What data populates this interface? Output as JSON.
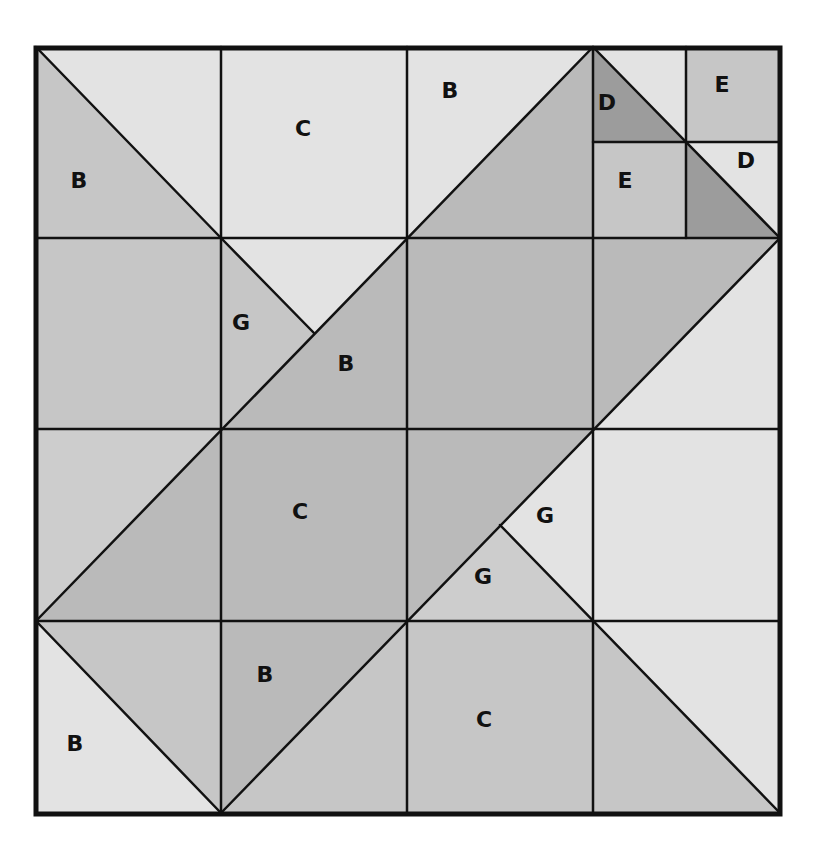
{
  "diagram": {
    "type": "quilt-block-pattern",
    "grid": {
      "rows": 4,
      "cols": 4,
      "x_lines": [
        36,
        221,
        407,
        593,
        780
      ],
      "y_lines": [
        47,
        238,
        429,
        621,
        813
      ],
      "sub_lines": {
        "x": 686,
        "y": 142
      }
    },
    "colors": {
      "light": "#e3e3e3",
      "light_medium": "#cdcdcd",
      "medium": "#c6c6c6",
      "dark": "#bababa",
      "darkest": "#9c9c9c",
      "line": "#111111",
      "label": "#111111"
    },
    "pieces": [
      {
        "id": "r0c0-light",
        "fill": "light",
        "points": "36,47 221,47 221,238"
      },
      {
        "id": "r0c0-B",
        "fill": "medium",
        "points": "36,47 221,238 36,238"
      },
      {
        "id": "r0c1-C",
        "fill": "light",
        "points": "221,47 407,47 407,238 221,238"
      },
      {
        "id": "r0c2-B",
        "fill": "light",
        "points": "407,47 593,47 407,238"
      },
      {
        "id": "r0c2-dark",
        "fill": "dark",
        "points": "593,47 593,238 407,238"
      },
      {
        "id": "r0c3-tl-light",
        "fill": "light",
        "points": "593,47 686,47 686,142"
      },
      {
        "id": "r0c3-tl-D",
        "fill": "darkest",
        "points": "593,47 686,142 593,142"
      },
      {
        "id": "r0c3-tr-E",
        "fill": "medium",
        "points": "686,47 780,47 780,142 686,142"
      },
      {
        "id": "r0c3-bl-E",
        "fill": "medium",
        "points": "593,142 686,142 686,238 593,238"
      },
      {
        "id": "r0c3-br-D-light",
        "fill": "light",
        "points": "686,142 780,142 780,238"
      },
      {
        "id": "r0c3-br-D-dark",
        "fill": "darkest",
        "points": "686,142 780,238 686,238"
      },
      {
        "id": "r1c0",
        "fill": "medium",
        "points": "36,238 221,238 221,429 36,429"
      },
      {
        "id": "r1c1-top",
        "fill": "light",
        "points": "221,238 407,238 314,333"
      },
      {
        "id": "r1c1-G",
        "fill": "medium",
        "points": "221,238 314,333 221,429"
      },
      {
        "id": "r1c1-B",
        "fill": "dark",
        "points": "407,238 407,429 221,429"
      },
      {
        "id": "r1c2",
        "fill": "dark",
        "points": "407,238 593,238 593,429 407,429"
      },
      {
        "id": "r1c3-dark",
        "fill": "dark",
        "points": "593,238 780,238 593,429"
      },
      {
        "id": "r1c3-light",
        "fill": "light",
        "points": "780,238 780,429 593,429"
      },
      {
        "id": "r2c0-light",
        "fill": "light_medium",
        "points": "36,429 221,429 36,621"
      },
      {
        "id": "r2c0-dark",
        "fill": "dark",
        "points": "221,429 221,621 36,621"
      },
      {
        "id": "r2c1-C",
        "fill": "dark",
        "points": "221,429 407,429 407,621 221,621"
      },
      {
        "id": "r2c2-dark",
        "fill": "dark",
        "points": "407,429 593,429 407,621"
      },
      {
        "id": "r2c2-G-right",
        "fill": "light",
        "points": "593,429 593,621 500,525"
      },
      {
        "id": "r2c2-G-bottom",
        "fill": "light_medium",
        "points": "407,621 500,525 593,621"
      },
      {
        "id": "r2c3",
        "fill": "light",
        "points": "593,429 780,429 780,621 593,621"
      },
      {
        "id": "r3c0-medium",
        "fill": "medium",
        "points": "36,621 221,621 221,813"
      },
      {
        "id": "r3c0-B",
        "fill": "light",
        "points": "36,621 221,813 36,813"
      },
      {
        "id": "r3c1-B",
        "fill": "dark",
        "points": "221,621 407,621 221,813"
      },
      {
        "id": "r3c1-medium",
        "fill": "medium",
        "points": "407,621 407,813 221,813"
      },
      {
        "id": "r3c2-C",
        "fill": "medium",
        "points": "407,621 593,621 593,813 407,813"
      },
      {
        "id": "r3c3-light",
        "fill": "light",
        "points": "593,621 780,621 780,813"
      },
      {
        "id": "r3c3-medium",
        "fill": "medium",
        "points": "593,621 780,813 593,813"
      }
    ],
    "lines": [
      {
        "x1": 221,
        "y1": 47,
        "x2": 221,
        "y2": 813
      },
      {
        "x1": 407,
        "y1": 47,
        "x2": 407,
        "y2": 813
      },
      {
        "x1": 593,
        "y1": 47,
        "x2": 593,
        "y2": 813
      },
      {
        "x1": 36,
        "y1": 238,
        "x2": 780,
        "y2": 238
      },
      {
        "x1": 36,
        "y1": 429,
        "x2": 780,
        "y2": 429
      },
      {
        "x1": 36,
        "y1": 621,
        "x2": 780,
        "y2": 621
      },
      {
        "x1": 686,
        "y1": 47,
        "x2": 686,
        "y2": 238
      },
      {
        "x1": 593,
        "y1": 142,
        "x2": 780,
        "y2": 142
      },
      {
        "x1": 36,
        "y1": 47,
        "x2": 221,
        "y2": 238
      },
      {
        "x1": 593,
        "y1": 47,
        "x2": 780,
        "y2": 238
      },
      {
        "x1": 221,
        "y1": 238,
        "x2": 314,
        "y2": 333
      },
      {
        "x1": 36,
        "y1": 621,
        "x2": 593,
        "y2": 47
      },
      {
        "x1": 221,
        "y1": 813,
        "x2": 780,
        "y2": 238
      },
      {
        "x1": 500,
        "y1": 525,
        "x2": 780,
        "y2": 813
      },
      {
        "x1": 36,
        "y1": 621,
        "x2": 221,
        "y2": 813
      }
    ],
    "labels": [
      {
        "text": "B",
        "x": 79,
        "y": 188
      },
      {
        "text": "C",
        "x": 303,
        "y": 136
      },
      {
        "text": "B",
        "x": 450,
        "y": 98
      },
      {
        "text": "D",
        "x": 607,
        "y": 110
      },
      {
        "text": "E",
        "x": 722,
        "y": 92
      },
      {
        "text": "E",
        "x": 625,
        "y": 188
      },
      {
        "text": "D",
        "x": 746,
        "y": 168
      },
      {
        "text": "G",
        "x": 241,
        "y": 330
      },
      {
        "text": "B",
        "x": 346,
        "y": 371
      },
      {
        "text": "C",
        "x": 300,
        "y": 519
      },
      {
        "text": "G",
        "x": 545,
        "y": 523
      },
      {
        "text": "G",
        "x": 483,
        "y": 584
      },
      {
        "text": "B",
        "x": 265,
        "y": 682
      },
      {
        "text": "B",
        "x": 75,
        "y": 751
      },
      {
        "text": "C",
        "x": 484,
        "y": 727
      }
    ]
  }
}
